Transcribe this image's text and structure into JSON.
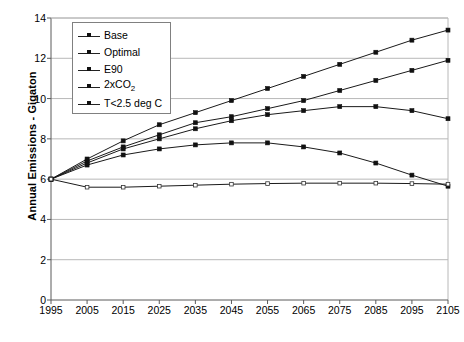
{
  "chart_data": {
    "type": "line",
    "title": "",
    "xlabel": "",
    "ylabel": "Annual Emissions - Gigaton",
    "categories": [
      1995,
      2005,
      2015,
      2025,
      2035,
      2045,
      2055,
      2065,
      2075,
      2085,
      2095,
      2105
    ],
    "xlim": [
      1995,
      2105
    ],
    "ylim": [
      0,
      14
    ],
    "yticks": [
      0,
      2,
      4,
      6,
      8,
      10,
      12,
      14
    ],
    "grid": "horizontal",
    "legend_position": "top-left",
    "series": [
      {
        "name": "Base",
        "values": [
          6.0,
          7.0,
          7.9,
          8.7,
          9.3,
          9.9,
          10.5,
          11.1,
          11.7,
          12.3,
          12.9,
          13.4
        ]
      },
      {
        "name": "Optimal",
        "values": [
          6.0,
          6.9,
          7.6,
          8.2,
          8.8,
          9.1,
          9.5,
          9.9,
          10.4,
          10.9,
          11.4,
          11.9
        ]
      },
      {
        "name": "E90",
        "values": [
          6.0,
          6.8,
          7.5,
          8.0,
          8.5,
          8.9,
          9.2,
          9.4,
          9.6,
          9.6,
          9.4,
          9.0
        ]
      },
      {
        "name": "2xCO2",
        "values": [
          6.0,
          6.7,
          7.2,
          7.5,
          7.7,
          7.8,
          7.8,
          7.6,
          7.3,
          6.8,
          6.2,
          5.65
        ]
      },
      {
        "name": "T<2.5 deg C",
        "values": [
          6.0,
          5.6,
          5.6,
          5.65,
          5.7,
          5.75,
          5.78,
          5.8,
          5.8,
          5.8,
          5.78,
          5.75
        ]
      }
    ]
  },
  "legend": {
    "items": [
      {
        "label": "Base",
        "key": "line-marker-key"
      },
      {
        "label": "Optimal",
        "key": "line-marker-key"
      },
      {
        "label": "E90",
        "key": "line-marker-key"
      },
      {
        "label": "2xCO2",
        "key": "line-marker-key",
        "html": "2xCO<sub>2</sub>"
      },
      {
        "label": "T<2.5 deg C",
        "key": "line-marker-key"
      }
    ]
  },
  "axes": {
    "y_title": "Annual Emissions - Gigaton",
    "y_ticks": [
      "0",
      "2",
      "4",
      "6",
      "8",
      "10",
      "12",
      "14"
    ],
    "x_ticks": [
      "1995",
      "2005",
      "2015",
      "2025",
      "2035",
      "2045",
      "2055",
      "2065",
      "2075",
      "2085",
      "2095",
      "2105"
    ]
  },
  "colors": {
    "line": "#1a1a1a",
    "grid": "#b8b8b8",
    "axis": "#5a5a5a",
    "background": "#ffffff"
  }
}
